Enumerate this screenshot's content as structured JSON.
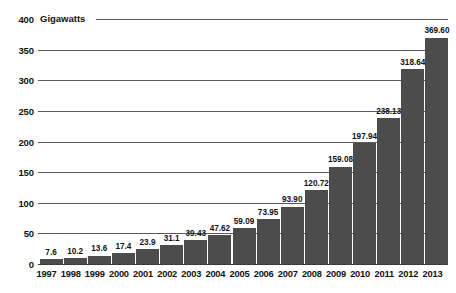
{
  "chart_data": {
    "type": "bar",
    "title": "",
    "unit_label": "Gigawatts",
    "xlabel": "",
    "ylabel": "Gigawatts",
    "ylim": [
      0,
      400
    ],
    "ytick_values": [
      0,
      50,
      100,
      150,
      200,
      250,
      300,
      350,
      400
    ],
    "ytick_labels": [
      "0",
      "50",
      "100",
      "150",
      "200",
      "250",
      "300",
      "350",
      "400"
    ],
    "grid": true,
    "legend": false,
    "bar_color": "#4c4c4c",
    "categories": [
      "1997",
      "1998",
      "1999",
      "2000",
      "2001",
      "2002",
      "2003",
      "2004",
      "2005",
      "2006",
      "2007",
      "2008",
      "2009",
      "2010",
      "2011",
      "2012",
      "2013"
    ],
    "values": [
      7.6,
      10.2,
      13.6,
      17.4,
      23.9,
      31.1,
      39.43,
      47.62,
      59.09,
      73.95,
      93.9,
      120.72,
      159.08,
      197.94,
      238.13,
      318.64,
      369.6
    ],
    "value_labels": [
      "7.6",
      "10.2",
      "13.6",
      "17.4",
      "23.9",
      "31.1",
      "39.43",
      "47.62",
      "59.09",
      "73.95",
      "93.90",
      "120.72",
      "159.08",
      "197.94",
      "238.13",
      "318.64",
      "369.60"
    ]
  }
}
